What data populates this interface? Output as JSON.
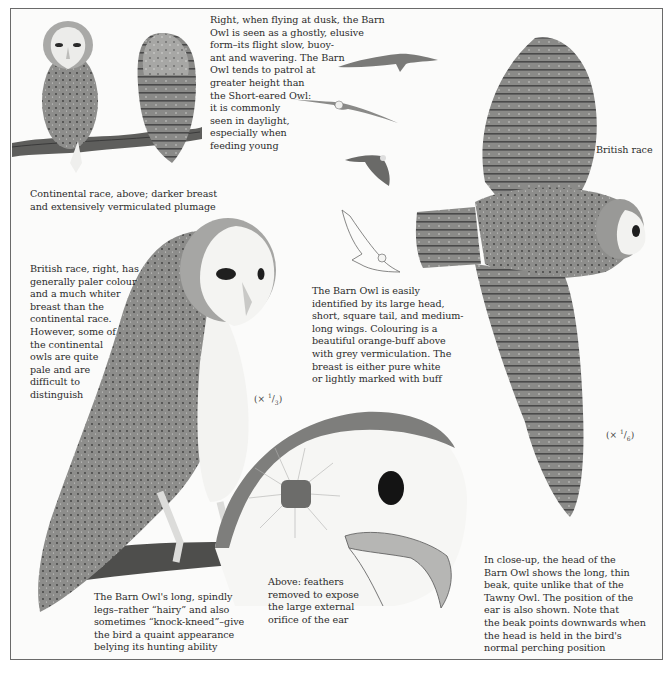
{
  "page": {
    "subject": "Barn Owl",
    "colors": {
      "paper": "#fbfbfa",
      "border": "#6a6a6a",
      "text": "#2b2b2b",
      "plumage_dark": "#6e6e6e",
      "plumage_mid": "#9a9a9a",
      "face_white": "#f4f4f2"
    }
  },
  "captions": {
    "flight_dusk": "Right, when flying at dusk, the Barn\nOwl is seen as a ghostly, elusive\nform–its flight slow, buoy-\nant and wavering. The Barn\nOwl tends to patrol at\ngreater height than\nthe Short-eared Owl:\nit is commonly\nseen in daylight,\nespecially when\nfeeding young",
    "continental_race": "Continental race, above; darker breast\nand extensively vermiculated plumage",
    "british_race_left": "British race, right, has\ngenerally paler colour\nand a much whiter\nbreast than the\ncontinental race.\nHowever, some of\nthe continental\nowls are quite\npale and are\ndifficult to\ndistinguish",
    "identification": "The Barn Owl is easily\nidentified by its large head,\nshort, square tail, and medium-\nlong wings. Colouring is a\nbeautiful orange-buff above\nwith grey vermiculation. The\nbreast is either pure white\nor lightly marked with buff",
    "british_race_label": "British race",
    "legs": "The Barn Owl's long, spindly\nlegs–rather “hairy” and also\nsometimes “knock-kneed”–give\nthe bird a quaint appearance\nbelying its hunting ability",
    "ear": "Above: feathers\nremoved to expose\nthe large external\norifice of the ear",
    "closeup": "In close-up, the head of the\nBarn Owl shows the long, thin\nbeak, quite unlike that of the\nTawny Owl. The position of the\near is also shown. Note that\nthe beak points downwards when\nthe head is held in the bird's\nnormal perching position"
  },
  "scales": {
    "perched": {
      "prefix": "(× ",
      "num": "1",
      "den": "3",
      "suffix": ")"
    },
    "flying": {
      "prefix": "(× ",
      "num": "1",
      "den": "6",
      "suffix": ")"
    }
  },
  "illustrations": [
    "continental-owl-front",
    "continental-owl-back",
    "flight-silhouette-1",
    "flight-silhouette-2",
    "flight-silhouette-3",
    "flight-silhouette-4",
    "british-owl-flying-top-view",
    "british-owl-perched",
    "owl-head-closeup-ear"
  ]
}
